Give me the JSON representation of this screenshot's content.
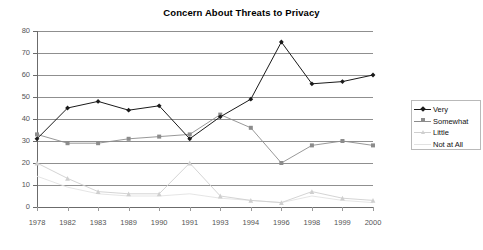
{
  "chart_data": {
    "type": "line",
    "title": "Concern About Threats to Privacy",
    "xlabel": "",
    "ylabel": "",
    "ylim": [
      0,
      80
    ],
    "yticks": [
      0,
      10,
      20,
      30,
      40,
      50,
      60,
      70,
      80
    ],
    "grid": true,
    "legend_position": "right",
    "categories": [
      "1978",
      "1982",
      "1983",
      "1989",
      "1990",
      "1991",
      "1993",
      "1994",
      "1996",
      "1998",
      "1999",
      "2000"
    ],
    "series": [
      {
        "name": "Very",
        "color": "#1a1a1a",
        "marker": "diamond",
        "values": [
          31,
          45,
          48,
          44,
          46,
          31,
          41,
          49,
          75,
          56,
          57,
          60
        ]
      },
      {
        "name": "Somewhat",
        "color": "#8c8c8c",
        "marker": "square",
        "values": [
          33,
          29,
          29,
          31,
          32,
          33,
          42,
          36,
          20,
          28,
          30,
          28
        ]
      },
      {
        "name": "Little",
        "color": "#cfcfcf",
        "marker": "triangle",
        "values": [
          20,
          13,
          7,
          6,
          6,
          20,
          5,
          3,
          2,
          7,
          4,
          3
        ]
      },
      {
        "name": "Not at All",
        "color": "#e2e2e2",
        "marker": "none",
        "values": [
          14,
          9,
          6,
          5,
          5,
          6,
          4,
          3,
          2,
          5,
          3,
          2
        ]
      }
    ]
  },
  "legend": {
    "entries": [
      {
        "label": "Very"
      },
      {
        "label": "Somewhat"
      },
      {
        "label": "Little"
      },
      {
        "label": "Not at All"
      }
    ]
  }
}
